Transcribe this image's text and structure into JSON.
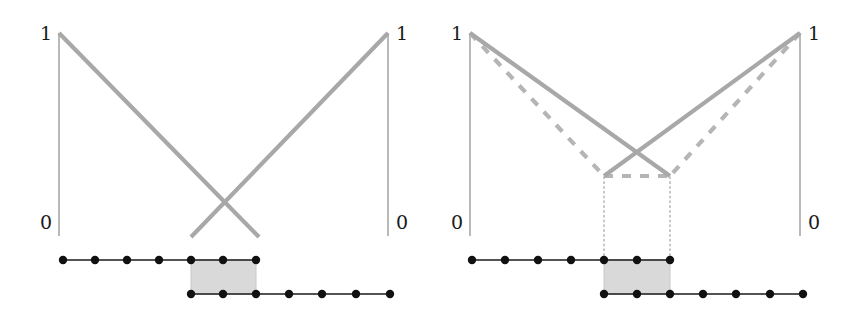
{
  "figure": {
    "width": 860,
    "height": 317,
    "background": "#ffffff",
    "panel_count": 2
  },
  "colors": {
    "axis": "#8a8a8a",
    "curve_solid": "#a8a8a8",
    "curve_dashed": "#b5b5b5",
    "guide_dotted": "#b0b0b0",
    "shaded_box_fill": "#d9d9d9",
    "shaded_box_stroke": "#c9c9c9",
    "lattice_line": "#1a1a1a",
    "lattice_dot": "#111111",
    "label_text": "#1a1a1a"
  },
  "panels": [
    {
      "id": "left",
      "name": "panel-without-dashed-reference",
      "axes": {
        "left": {
          "x": 59,
          "y_top": 33,
          "y_bottom": 236,
          "top_label": "1",
          "bottom_label": "0",
          "top_label_x": 40,
          "top_label_y": 24,
          "bottom_label_x": 40,
          "bottom_label_y": 213
        },
        "right": {
          "x": 388,
          "y_top": 33,
          "y_bottom": 236,
          "top_label": "1",
          "bottom_label": "0",
          "top_label_x": 396,
          "top_label_y": 24,
          "bottom_label_x": 396,
          "bottom_label_y": 213
        }
      },
      "curves": [
        {
          "name": "descending-solid-curve",
          "style": "solid",
          "points": [
            [
              59,
              33
            ],
            [
              259,
              237
            ]
          ]
        },
        {
          "name": "ascending-solid-curve",
          "style": "solid",
          "points": [
            [
              388,
              33
            ],
            [
              191,
              237
            ]
          ]
        }
      ],
      "dashed_curves": [],
      "guides": [],
      "shaded_box": {
        "x": 191,
        "y": 260,
        "width": 65,
        "height": 34
      },
      "lattice": {
        "top_row": {
          "y": 260,
          "x_start": 63,
          "x_end": 256,
          "dot_xs": [
            63,
            95,
            127,
            159,
            191,
            223,
            256
          ]
        },
        "bottom_row": {
          "y": 294,
          "x_start": 191,
          "x_end": 390,
          "dot_xs": [
            191,
            223,
            256,
            289,
            322,
            356,
            390
          ]
        }
      }
    },
    {
      "id": "right",
      "name": "panel-with-dashed-reference",
      "axes": {
        "left": {
          "x": 40,
          "y_top": 33,
          "y_bottom": 236,
          "top_label": "1",
          "bottom_label": "0",
          "top_label_x": 21,
          "top_label_y": 24,
          "bottom_label_x": 21,
          "bottom_label_y": 213
        },
        "right": {
          "x": 370,
          "y_top": 33,
          "y_bottom": 236,
          "top_label": "1",
          "bottom_label": "0",
          "top_label_x": 378,
          "top_label_y": 24,
          "bottom_label_x": 378,
          "bottom_label_y": 213
        }
      },
      "curves": [
        {
          "name": "descending-solid-curve",
          "style": "solid",
          "points": [
            [
              40,
              33
            ],
            [
              240,
              176
            ]
          ]
        },
        {
          "name": "ascending-solid-curve",
          "style": "solid",
          "points": [
            [
              370,
              33
            ],
            [
              174,
              176
            ]
          ]
        }
      ],
      "dashed_curves": [
        {
          "name": "descending-dashed-curve",
          "style": "dashed",
          "points": [
            [
              40,
              33
            ],
            [
              174,
              176
            ]
          ]
        },
        {
          "name": "ascending-dashed-curve",
          "style": "dashed",
          "points": [
            [
              370,
              33
            ],
            [
              240,
              176
            ]
          ]
        },
        {
          "name": "plateau-dashed-curve",
          "style": "dashed",
          "points": [
            [
              174,
              176
            ],
            [
              240,
              176
            ]
          ]
        }
      ],
      "guides": [
        {
          "name": "left-dotted-guide",
          "points": [
            [
              174,
              177
            ],
            [
              174,
              260
            ]
          ]
        },
        {
          "name": "right-dotted-guide",
          "points": [
            [
              240,
              177
            ],
            [
              240,
              260
            ]
          ]
        }
      ],
      "shaded_box": {
        "x": 174,
        "y": 260,
        "width": 66,
        "height": 34
      },
      "lattice": {
        "top_row": {
          "y": 260,
          "x_start": 42,
          "x_end": 240,
          "dot_xs": [
            42,
            75,
            108,
            141,
            174,
            207,
            240
          ]
        },
        "bottom_row": {
          "y": 294,
          "x_start": 174,
          "x_end": 373,
          "dot_xs": [
            174,
            207,
            240,
            273,
            306,
            340,
            373
          ]
        }
      }
    }
  ]
}
